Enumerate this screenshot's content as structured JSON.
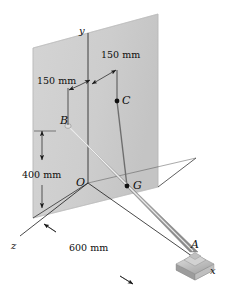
{
  "figure": {
    "type": "engineering-statics-3d-diagram"
  },
  "points": [
    {
      "id": "B",
      "label": "B",
      "x": 60,
      "y": 121,
      "dot": false
    },
    {
      "id": "C",
      "label": "C",
      "x": 122,
      "y": 96,
      "dot": true
    },
    {
      "id": "G",
      "label": "G",
      "x": 133,
      "y": 181,
      "dot": true
    },
    {
      "id": "A",
      "label": "A",
      "x": 191,
      "y": 240,
      "dot": false
    },
    {
      "id": "O",
      "label": "O",
      "x": 76,
      "y": 178,
      "dot": false
    }
  ],
  "axes": [
    {
      "id": "y",
      "label": "y",
      "x": 79,
      "y": 27
    },
    {
      "id": "z",
      "label": "z",
      "x": 11,
      "y": 243
    },
    {
      "id": "x",
      "label": "x",
      "x": 210,
      "y": 268
    }
  ],
  "dimensions": [
    {
      "id": "d1",
      "label": "150 mm",
      "x": 101,
      "y": 57
    },
    {
      "id": "d2",
      "label": "150 mm",
      "x": 41,
      "y": 81
    },
    {
      "id": "d3",
      "label": "400 mm",
      "x": 24,
      "y": 175
    },
    {
      "id": "d4",
      "label": "600 mm",
      "x": 73,
      "y": 247
    }
  ],
  "colors": {
    "wall": "#cfcfcf",
    "wall_edge": "#9a9a9a",
    "rod_light": "#e8e8e8",
    "rod_mid": "#b8b8b8",
    "rod_dark": "#8e8e8e",
    "base": "#c6c6c6",
    "line": "#1a1a1a",
    "text": "#0d0d0d"
  }
}
